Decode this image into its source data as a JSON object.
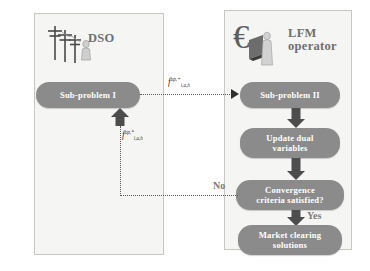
{
  "diagram": {
    "panels": [
      {
        "id": "dso",
        "title": "DSO",
        "icon": "power-tower-icon"
      },
      {
        "id": "lfm",
        "title": "LFM\noperator",
        "title_line1": "LFM",
        "title_line2": "operator",
        "icon": "euro-operator-icon"
      }
    ],
    "nodes": {
      "sub_problem_1": "Sub-problem I",
      "sub_problem_2": "Sub-problem II",
      "update_dual": "Update dual\nvariables",
      "update_dual_line1": "Update dual",
      "update_dual_line2": "variables",
      "convergence": "Convergence\ncriteria satisfied?",
      "convergence_line1": "Convergence",
      "convergence_line2": "criteria satisfied?",
      "market": "Market clearing\nsolutions",
      "market_line1": "Market clearing",
      "market_line2": "solutions"
    },
    "flow_labels": {
      "forward_base": "f",
      "forward_sup": "up,+",
      "forward_sub": "i,a,h",
      "backward_base": "f",
      "backward_sup": "up,*",
      "backward_sub": "i,a,h"
    },
    "branch_labels": {
      "no": "No",
      "yes": "Yes"
    },
    "colors": {
      "node_fill": "#8b8b8b",
      "node_text": "#ffffff",
      "panel_fill": "#f5f5f4",
      "panel_border": "#c9c6c2",
      "arrow_fill": "#4d4d4d",
      "dotted_line": "#5a5a5a",
      "title_text": "#6f6f72",
      "branch_text": "#7a7a7a"
    }
  }
}
